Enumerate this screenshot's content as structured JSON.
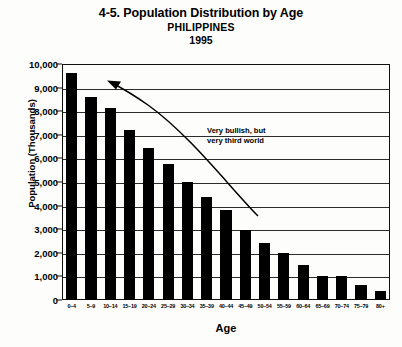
{
  "chart_data": {
    "type": "bar",
    "title": "4-5. Population Distribution by Age",
    "subtitle": "PHILIPPINES",
    "year": "1995",
    "xlabel": "Age",
    "ylabel": "Population (Thousands)",
    "categories": [
      "0–4",
      "5–9",
      "10–14",
      "15–19",
      "20–24",
      "25–29",
      "30–34",
      "35–39",
      "40–44",
      "45–49",
      "50–54",
      "55–59",
      "60–64",
      "65–69",
      "70–74",
      "75–79",
      "80+"
    ],
    "values": [
      9600,
      8600,
      8150,
      7200,
      6450,
      5750,
      5000,
      4350,
      3800,
      2950,
      2400,
      2000,
      1500,
      1000,
      1000,
      650,
      400
    ],
    "ylim": [
      0,
      10000
    ],
    "ytick_labels": [
      "10,000",
      "9,000",
      "8,000",
      "7,000",
      "6,000",
      "5,000",
      "4,000",
      "3,000",
      "2,000",
      "1,000",
      "0"
    ],
    "ytick_values": [
      10000,
      9000,
      8000,
      7000,
      6000,
      5000,
      4000,
      3000,
      2000,
      1000,
      0
    ],
    "grid": true,
    "legend": "none",
    "bar_color": "#000000",
    "annotations": [
      {
        "text_line_1": "Very bullish, but",
        "text_line_2": "very third world",
        "arrow": "curved-arrow-pointing-up-left"
      }
    ]
  }
}
